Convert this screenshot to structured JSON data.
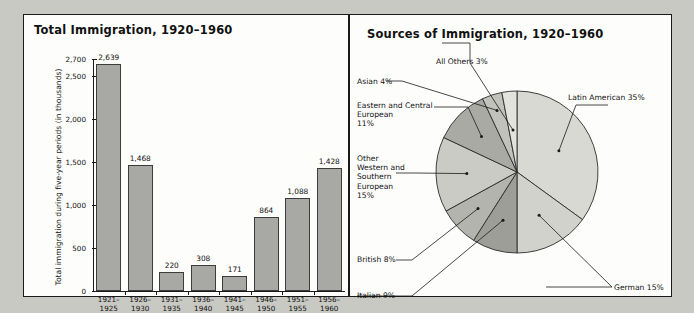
{
  "figure": {
    "background_color": "#c9c9c4",
    "panel_background": "#fdfdfb",
    "border_color": "#1a1a1a"
  },
  "bar_panel": {
    "title": "Total Immigration, 1920–1960",
    "y_axis_title": "Total immigration during five-year periods (in thousands)"
  },
  "pie_panel": {
    "title": "Sources of Immigration, 1920–1960"
  },
  "chart_data": [
    {
      "type": "bar",
      "title": "Total Immigration, 1920–1960",
      "xlabel": "",
      "ylabel": "Total immigration during five-year periods (in thousands)",
      "ylim": [
        0,
        2700
      ],
      "grid": false,
      "yticks": [
        0,
        500,
        1000,
        1500,
        2000,
        2500,
        2700
      ],
      "ytick_labels": [
        "0",
        "500",
        "1,000",
        "1,500",
        "2,000",
        "2,500",
        "2,700"
      ],
      "categories": [
        "1921–\n1925",
        "1926–\n1930",
        "1931–\n1935",
        "1936–\n1940",
        "1941–\n1945",
        "1946–\n1950",
        "1951–\n1955",
        "1956–\n1960"
      ],
      "values": [
        2639,
        1468,
        220,
        308,
        171,
        864,
        1088,
        1428
      ],
      "value_labels": [
        "2,639",
        "1,468",
        "220",
        "308",
        "171",
        "864",
        "1,088",
        "1,428"
      ],
      "bar_color": "#a8a8a4",
      "bar_edge_color": "#3c3c3c"
    },
    {
      "type": "pie",
      "title": "Sources of Immigration, 1920–1960",
      "legend": "labels-with-leader-lines",
      "slices": [
        {
          "label": "Latin American 35%",
          "name": "Latin American",
          "value": 35,
          "color": "#d9d9d4"
        },
        {
          "label": "German 15%",
          "name": "German",
          "value": 15,
          "color": "#d2d2cd"
        },
        {
          "label": "Italian 9%",
          "name": "Italian",
          "value": 9,
          "color": "#9e9e99"
        },
        {
          "label": "British 8%",
          "name": "British",
          "value": 8,
          "color": "#b4b4af"
        },
        {
          "label": "Other\nWestern and\nSouthern\nEuropean\n15%",
          "name": "Other Western and Southern European",
          "value": 15,
          "color": "#cbcbc6"
        },
        {
          "label": "Eastern and Central\nEuropean\n11%",
          "name": "Eastern and Central European",
          "value": 11,
          "color": "#aaaaa5"
        },
        {
          "label": "Asian 4%",
          "name": "Asian",
          "value": 4,
          "color": "#c2c2bd"
        },
        {
          "label": "All Others 3%",
          "name": "All Others",
          "value": 3,
          "color": "#e3e3de"
        }
      ]
    }
  ],
  "bar_chart": {
    "bars": [
      {
        "period": "1921–\n1925",
        "value_label": "2,639"
      },
      {
        "period": "1926–\n1930",
        "value_label": "1,468"
      },
      {
        "period": "1931–\n1935",
        "value_label": "220"
      },
      {
        "period": "1936–\n1940",
        "value_label": "308"
      },
      {
        "period": "1941–\n1945",
        "value_label": "171"
      },
      {
        "period": "1946–\n1950",
        "value_label": "864"
      },
      {
        "period": "1951–\n1955",
        "value_label": "1,088"
      },
      {
        "period": "1956–\n1960",
        "value_label": "1,428"
      }
    ],
    "ytick_labels": [
      "0",
      "500",
      "1,000",
      "1,500",
      "2,000",
      "2,500",
      "2,700"
    ]
  },
  "pie_labels": {
    "latin_american": "Latin American 35%",
    "german": "German 15%",
    "italian": "Italian 9%",
    "british": "British 8%",
    "other_western_southern": "Other\nWestern and\nSouthern\nEuropean\n15%",
    "eastern_central": "Eastern and Central\nEuropean\n11%",
    "asian": "Asian 4%",
    "all_others": "All Others 3%"
  }
}
